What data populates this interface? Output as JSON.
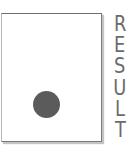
{
  "diagram": {
    "card": {
      "border_color": "#7a7a7a",
      "fill": "#ffffff"
    },
    "dot": {
      "color": "#5b5b5b",
      "shape": "circle"
    },
    "label": {
      "text": "RESULT",
      "letters": [
        "R",
        "E",
        "S",
        "U",
        "L",
        "T"
      ],
      "orientation": "vertical-stacked",
      "color": "#6b6b6b"
    }
  }
}
